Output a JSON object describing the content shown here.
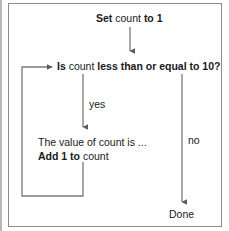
{
  "figure": {
    "border_color": "#8c8c8c",
    "line_color": "#6e6e6e",
    "text_color": "#1a1a1a"
  },
  "nodes": {
    "init": {
      "segments": [
        {
          "text": "Set",
          "bold": true
        },
        {
          "text": " count ",
          "bold": false
        },
        {
          "text": "to 1",
          "bold": true
        }
      ],
      "plain": "Set count to 1"
    },
    "condition": {
      "segments": [
        {
          "text": "Is",
          "bold": true
        },
        {
          "text": " count ",
          "bold": false
        },
        {
          "text": "less than or equal to 10?",
          "bold": true
        }
      ],
      "plain": "Is count less than or equal to 10?"
    },
    "body_line1": {
      "segments": [
        {
          "text": "The value of count is ...",
          "bold": false
        }
      ],
      "plain": "The value of count is ..."
    },
    "body_line2": {
      "segments": [
        {
          "text": "Add 1 to",
          "bold": true
        },
        {
          "text": " count",
          "bold": false
        }
      ],
      "plain": "Add 1 to count"
    },
    "end": {
      "plain": "Done"
    }
  },
  "edges": {
    "yes_label": "yes",
    "no_label": "no"
  }
}
